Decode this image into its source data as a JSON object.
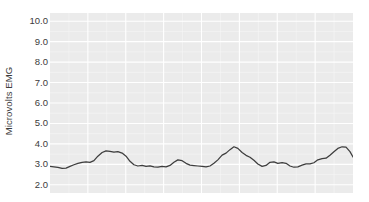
{
  "chart_data": {
    "type": "line",
    "title": "",
    "xlabel": "",
    "ylabel": "Microvolts EMG",
    "ylim": [
      1.6,
      10.4
    ],
    "xlim": [
      0,
      100
    ],
    "grid": true,
    "legend": "none",
    "y_ticks": [
      "10.0",
      "9.0",
      "8.0",
      "7.0",
      "6.0",
      "5.0",
      "4.0",
      "3.0",
      "2.0"
    ],
    "y_tick_values": [
      10.0,
      9.0,
      8.0,
      7.0,
      6.0,
      5.0,
      4.0,
      3.0,
      2.0
    ],
    "x_ticks": [],
    "x_tick_values": [],
    "series": [
      {
        "name": "EMG",
        "color": "#3d3d3d",
        "x": [
          0.0,
          1.3,
          2.6,
          4.0,
          5.3,
          6.6,
          7.9,
          9.2,
          10.6,
          11.9,
          13.2,
          14.5,
          15.8,
          17.2,
          18.5,
          19.8,
          21.1,
          22.4,
          23.8,
          25.1,
          26.4,
          27.7,
          29.0,
          30.4,
          31.7,
          33.0,
          34.3,
          35.6,
          37.0,
          38.3,
          39.6,
          40.9,
          42.2,
          43.6,
          44.9,
          46.2,
          47.5,
          48.8,
          50.2,
          51.5,
          52.8,
          54.1,
          55.4,
          56.8,
          58.1,
          59.4,
          60.7,
          62.0,
          63.4,
          64.7,
          66.0,
          67.3,
          68.6,
          70.0,
          71.3,
          72.6,
          73.9,
          75.2,
          76.6,
          77.9,
          79.2,
          80.5,
          81.8,
          83.2,
          84.5,
          85.8,
          87.1,
          88.4,
          89.8,
          91.1,
          92.4,
          93.7,
          95.0,
          96.4,
          97.7,
          99.0,
          100.0
        ],
        "values": [
          2.9,
          2.88,
          2.85,
          2.8,
          2.82,
          2.9,
          2.98,
          3.05,
          3.1,
          3.12,
          3.1,
          3.18,
          3.4,
          3.58,
          3.66,
          3.64,
          3.6,
          3.62,
          3.55,
          3.4,
          3.15,
          2.98,
          2.92,
          2.95,
          2.9,
          2.93,
          2.88,
          2.86,
          2.9,
          2.88,
          2.95,
          3.1,
          3.22,
          3.18,
          3.05,
          2.96,
          2.94,
          2.92,
          2.9,
          2.88,
          2.92,
          3.05,
          3.22,
          3.45,
          3.55,
          3.72,
          3.86,
          3.78,
          3.58,
          3.44,
          3.35,
          3.2,
          3.02,
          2.9,
          2.95,
          3.1,
          3.12,
          3.05,
          3.08,
          3.05,
          2.92,
          2.86,
          2.88,
          2.96,
          3.02,
          3.02,
          3.08,
          3.22,
          3.28,
          3.3,
          3.45,
          3.62,
          3.78,
          3.86,
          3.84,
          3.62,
          3.36
        ]
      }
    ]
  },
  "axis": {
    "y_title": "Microvolts EMG"
  }
}
